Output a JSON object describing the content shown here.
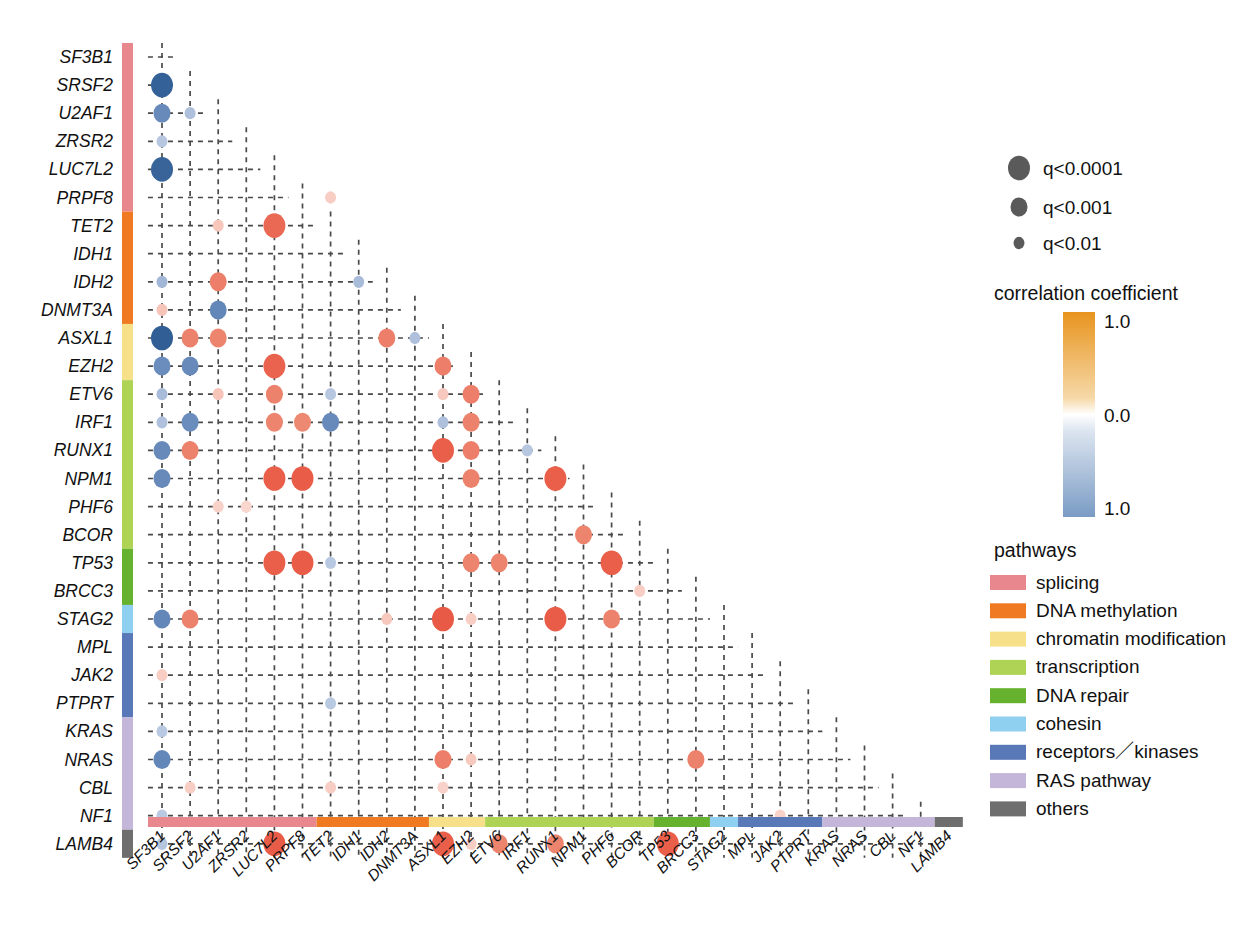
{
  "chart_data": {
    "type": "heatmap",
    "title": "",
    "subtitle": "",
    "xlabel": "",
    "ylabel": "",
    "grid": true,
    "legend_position": "right",
    "genes": [
      "SF3B1",
      "SRSF2",
      "U2AF1",
      "ZRSR2",
      "LUC7L2",
      "PRPF8",
      "TET2",
      "IDH1",
      "IDH2",
      "DNMT3A",
      "ASXL1",
      "EZH2",
      "ETV6",
      "IRF1",
      "RUNX1",
      "NPM1",
      "PHF6",
      "BCOR",
      "TP53",
      "BRCC3",
      "STAG2",
      "MPL",
      "JAK2",
      "PTPRT",
      "KRAS",
      "NRAS",
      "CBL",
      "NF1",
      "LAMB4"
    ],
    "categories": [
      "SF3B1",
      "SRSF2",
      "U2AF1",
      "ZRSR2",
      "LUC7L2",
      "PRPF8",
      "TET2",
      "IDH1",
      "IDH2",
      "DNMT3A",
      "ASXL1",
      "EZH2",
      "ETV6",
      "IRF1",
      "RUNX1",
      "NPM1",
      "PHF6",
      "BCOR",
      "TP53",
      "BRCC3",
      "STAG2",
      "MPL",
      "JAK2",
      "PTPRT",
      "KRAS",
      "NRAS",
      "CBL",
      "NF1",
      "LAMB4"
    ],
    "xlim": [
      0,
      29
    ],
    "ylim": [
      0,
      29
    ],
    "color_scale": {
      "label": "correlation coefficient",
      "max_label": "1.0",
      "mid_label": "0.0",
      "min_label": "1.0",
      "positive_color": "#E8941E",
      "zero_color": "#FFFFFF",
      "negative_color": "#7A9BC4",
      "note": "top of bar = +1.0 (orange), middle = 0.0 (white), bottom = 1.0 magnitude negative (blue)"
    },
    "size_scale": {
      "labels": [
        "q<0.0001",
        "q<0.001",
        "q<0.01"
      ],
      "radii": [
        11,
        8.5,
        5.5
      ],
      "color": "#5a5a5a"
    },
    "points": [
      {
        "r": 1,
        "c": 0,
        "v": -0.95,
        "q": 0
      },
      {
        "r": 2,
        "c": 0,
        "v": -0.55,
        "q": 1
      },
      {
        "r": 2,
        "c": 1,
        "v": -0.28,
        "q": 2
      },
      {
        "r": 3,
        "c": 0,
        "v": -0.25,
        "q": 2
      },
      {
        "r": 4,
        "c": 0,
        "v": -0.92,
        "q": 0
      },
      {
        "r": 6,
        "c": 2,
        "v": 0.25,
        "q": 2
      },
      {
        "r": 6,
        "c": 4,
        "v": 0.8,
        "q": 0
      },
      {
        "r": 5,
        "c": 6,
        "v": 0.22,
        "q": 2
      },
      {
        "r": 8,
        "c": 0,
        "v": -0.32,
        "q": 2
      },
      {
        "r": 8,
        "c": 2,
        "v": 0.62,
        "q": 1
      },
      {
        "r": 8,
        "c": 7,
        "v": -0.3,
        "q": 2
      },
      {
        "r": 9,
        "c": 0,
        "v": 0.26,
        "q": 2
      },
      {
        "r": 9,
        "c": 2,
        "v": -0.58,
        "q": 1
      },
      {
        "r": 10,
        "c": 0,
        "v": -0.98,
        "q": 0
      },
      {
        "r": 10,
        "c": 1,
        "v": 0.6,
        "q": 1
      },
      {
        "r": 10,
        "c": 2,
        "v": 0.58,
        "q": 1
      },
      {
        "r": 10,
        "c": 8,
        "v": 0.62,
        "q": 1
      },
      {
        "r": 10,
        "c": 9,
        "v": -0.28,
        "q": 2
      },
      {
        "r": 11,
        "c": 0,
        "v": -0.52,
        "q": 1
      },
      {
        "r": 11,
        "c": 1,
        "v": -0.55,
        "q": 1
      },
      {
        "r": 11,
        "c": 4,
        "v": 0.85,
        "q": 0
      },
      {
        "r": 11,
        "c": 10,
        "v": 0.62,
        "q": 1
      },
      {
        "r": 12,
        "c": 0,
        "v": -0.3,
        "q": 2
      },
      {
        "r": 12,
        "c": 2,
        "v": 0.26,
        "q": 2
      },
      {
        "r": 12,
        "c": 4,
        "v": 0.6,
        "q": 1
      },
      {
        "r": 12,
        "c": 6,
        "v": -0.25,
        "q": 2
      },
      {
        "r": 12,
        "c": 10,
        "v": 0.24,
        "q": 2
      },
      {
        "r": 12,
        "c": 11,
        "v": 0.62,
        "q": 1
      },
      {
        "r": 13,
        "c": 0,
        "v": -0.28,
        "q": 2
      },
      {
        "r": 13,
        "c": 1,
        "v": -0.52,
        "q": 1
      },
      {
        "r": 13,
        "c": 4,
        "v": 0.58,
        "q": 1
      },
      {
        "r": 13,
        "c": 5,
        "v": 0.55,
        "q": 1
      },
      {
        "r": 13,
        "c": 6,
        "v": -0.55,
        "q": 1
      },
      {
        "r": 13,
        "c": 10,
        "v": -0.28,
        "q": 2
      },
      {
        "r": 13,
        "c": 11,
        "v": 0.6,
        "q": 1
      },
      {
        "r": 14,
        "c": 0,
        "v": -0.55,
        "q": 1
      },
      {
        "r": 14,
        "c": 1,
        "v": 0.6,
        "q": 1
      },
      {
        "r": 14,
        "c": 10,
        "v": 0.88,
        "q": 0
      },
      {
        "r": 14,
        "c": 11,
        "v": 0.62,
        "q": 1
      },
      {
        "r": 14,
        "c": 13,
        "v": -0.25,
        "q": 2
      },
      {
        "r": 15,
        "c": 0,
        "v": -0.55,
        "q": 1
      },
      {
        "r": 15,
        "c": 4,
        "v": 0.88,
        "q": 0
      },
      {
        "r": 15,
        "c": 5,
        "v": 0.9,
        "q": 0
      },
      {
        "r": 15,
        "c": 11,
        "v": 0.6,
        "q": 1
      },
      {
        "r": 15,
        "c": 14,
        "v": 0.88,
        "q": 0
      },
      {
        "r": 16,
        "c": 2,
        "v": 0.2,
        "q": 2
      },
      {
        "r": 16,
        "c": 3,
        "v": 0.18,
        "q": 2
      },
      {
        "r": 17,
        "c": 15,
        "v": 0.58,
        "q": 1
      },
      {
        "r": 18,
        "c": 4,
        "v": 0.88,
        "q": 0
      },
      {
        "r": 18,
        "c": 5,
        "v": 0.9,
        "q": 0
      },
      {
        "r": 18,
        "c": 6,
        "v": -0.24,
        "q": 2
      },
      {
        "r": 18,
        "c": 11,
        "v": 0.58,
        "q": 1
      },
      {
        "r": 18,
        "c": 12,
        "v": 0.58,
        "q": 1
      },
      {
        "r": 18,
        "c": 16,
        "v": 0.88,
        "q": 0
      },
      {
        "r": 19,
        "c": 17,
        "v": 0.22,
        "q": 2
      },
      {
        "r": 20,
        "c": 0,
        "v": -0.58,
        "q": 1
      },
      {
        "r": 20,
        "c": 1,
        "v": 0.6,
        "q": 1
      },
      {
        "r": 20,
        "c": 8,
        "v": 0.24,
        "q": 2
      },
      {
        "r": 20,
        "c": 10,
        "v": 0.92,
        "q": 0
      },
      {
        "r": 20,
        "c": 11,
        "v": 0.22,
        "q": 2
      },
      {
        "r": 20,
        "c": 14,
        "v": 0.9,
        "q": 0
      },
      {
        "r": 20,
        "c": 16,
        "v": 0.6,
        "q": 1
      },
      {
        "r": 22,
        "c": 0,
        "v": 0.22,
        "q": 2
      },
      {
        "r": 23,
        "c": 6,
        "v": -0.24,
        "q": 2
      },
      {
        "r": 24,
        "c": 0,
        "v": -0.24,
        "q": 2
      },
      {
        "r": 25,
        "c": 0,
        "v": -0.58,
        "q": 1
      },
      {
        "r": 25,
        "c": 10,
        "v": 0.62,
        "q": 1
      },
      {
        "r": 25,
        "c": 11,
        "v": 0.24,
        "q": 2
      },
      {
        "r": 25,
        "c": 19,
        "v": 0.6,
        "q": 1
      },
      {
        "r": 26,
        "c": 1,
        "v": 0.22,
        "q": 2
      },
      {
        "r": 26,
        "c": 6,
        "v": 0.22,
        "q": 2
      },
      {
        "r": 26,
        "c": 10,
        "v": 0.2,
        "q": 2
      },
      {
        "r": 27,
        "c": 0,
        "v": -0.24,
        "q": 2
      },
      {
        "r": 27,
        "c": 22,
        "v": 0.2,
        "q": 2
      },
      {
        "r": 28,
        "c": 0,
        "v": -0.26,
        "q": 2
      },
      {
        "r": 28,
        "c": 4,
        "v": 0.9,
        "q": 0
      },
      {
        "r": 28,
        "c": 10,
        "v": 0.88,
        "q": 0
      },
      {
        "r": 28,
        "c": 11,
        "v": 0.22,
        "q": 2
      },
      {
        "r": 28,
        "c": 12,
        "v": 0.58,
        "q": 1
      },
      {
        "r": 28,
        "c": 14,
        "v": 0.58,
        "q": 1
      },
      {
        "r": 28,
        "c": 18,
        "v": 0.88,
        "q": 0
      }
    ]
  },
  "pathways": {
    "title": "pathways",
    "items": [
      {
        "label": "splicing",
        "color": "#E8888E"
      },
      {
        "label": "DNA methylation",
        "color": "#F07A22"
      },
      {
        "label": "chromatin modification",
        "color": "#F7E08A"
      },
      {
        "label": "transcription",
        "color": "#AED355"
      },
      {
        "label": "DNA repair",
        "color": "#66B22E"
      },
      {
        "label": "cohesin",
        "color": "#8FD0F0"
      },
      {
        "label": "receptors／kinases",
        "color": "#5878B8"
      },
      {
        "label": "RAS pathway",
        "color": "#C3B6D8"
      },
      {
        "label": "others",
        "color": "#6E6E6E"
      }
    ],
    "gene_groups": [
      {
        "pathway": "splicing",
        "start": 0,
        "end": 5
      },
      {
        "pathway": "DNA methylation",
        "start": 6,
        "end": 9
      },
      {
        "pathway": "chromatin modification",
        "start": 10,
        "end": 11
      },
      {
        "pathway": "transcription",
        "start": 12,
        "end": 17
      },
      {
        "pathway": "DNA repair",
        "start": 18,
        "end": 19
      },
      {
        "pathway": "cohesin",
        "start": 20,
        "end": 20
      },
      {
        "pathway": "receptors／kinases",
        "start": 21,
        "end": 23
      },
      {
        "pathway": "RAS pathway",
        "start": 24,
        "end": 27
      },
      {
        "pathway": "others",
        "start": 28,
        "end": 28
      }
    ]
  },
  "significance_legend": {
    "items": [
      {
        "label": "q<0.0001",
        "radius": 11
      },
      {
        "label": "q<0.001",
        "radius": 8.5
      },
      {
        "label": "q<0.01",
        "radius": 5.5
      }
    ]
  }
}
